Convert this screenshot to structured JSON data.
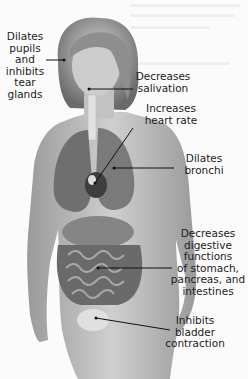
{
  "diagram": {
    "type": "anatomical-illustration",
    "labels": [
      {
        "id": "eyes",
        "text": "Dilates\npupils\nand\ninhibits\ntear\nglands"
      },
      {
        "id": "salivary",
        "text": "Decreases\nsalivation"
      },
      {
        "id": "heart",
        "text": "Increases\nheart rate"
      },
      {
        "id": "lungs",
        "text": "Dilates\nbronchi"
      },
      {
        "id": "digestive",
        "text": "Decreases\ndigestive\nfunctions\nof stomach,\npancreas, and\nintestines"
      },
      {
        "id": "bladder",
        "text": "Inhibits\nbladder\ncontraction"
      }
    ],
    "colors": {
      "background": "#fbfbfb",
      "skin": "#b9b9b9",
      "organ_dark": "#5a5a5a",
      "leader_line": "#111111",
      "text": "#1c1c1c"
    }
  }
}
